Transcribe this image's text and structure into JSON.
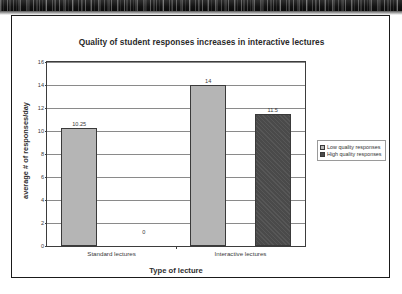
{
  "figure": {
    "title": "Quality of student responses increases in interactive lectures"
  },
  "chart_data": {
    "type": "bar",
    "title": "Quality of student responses increases in interactive lectures",
    "xlabel": "Type of lecture",
    "ylabel": "average # of responses/day",
    "categories": [
      "Standard lectures",
      "Interactive lectures"
    ],
    "series": [
      {
        "name": "Low quality responses",
        "color": "#b5b5b5",
        "values": [
          10.25,
          14
        ],
        "labels": [
          "10.25",
          "14"
        ]
      },
      {
        "name": "High quality responses",
        "color": "#4a4a4a",
        "values": [
          0,
          11.5
        ],
        "labels": [
          "0",
          "11.5"
        ]
      }
    ],
    "ylim": [
      0,
      16
    ],
    "ytick_step": 2,
    "yticks": [
      16,
      14,
      12,
      10,
      8,
      6,
      4,
      2,
      0
    ],
    "ytick_labels": [
      "16",
      "14",
      "12",
      "10",
      "8",
      "6",
      "4",
      "2",
      "0"
    ],
    "grid": true,
    "legend_position": "right-outside"
  },
  "legend": {
    "items": [
      {
        "label": "Low quality responses",
        "swatch": "light-gray-swatch-icon"
      },
      {
        "label": "High quality responses",
        "swatch": "dark-gray-swatch-icon"
      }
    ]
  }
}
